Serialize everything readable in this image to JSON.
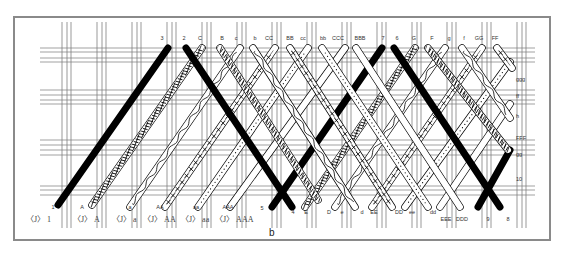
{
  "figure": {
    "caption": "b",
    "frame_color": "#8a8a8a",
    "ink_color": "#000000"
  },
  "top_labels": [
    "3",
    "2",
    "C",
    "B",
    "c",
    "b",
    "CC",
    "BB",
    "cc",
    "bb",
    "CCC",
    "BBB",
    "7",
    "6",
    "G",
    "F",
    "g",
    "f",
    "GG",
    "FF"
  ],
  "bottom_labels": [
    "1",
    "A",
    "a",
    "AA",
    "aa",
    "AAA",
    "5",
    "4",
    "E",
    "D",
    "e",
    "d",
    "EE",
    "DD",
    "ee",
    "dd",
    "EEE",
    "DDD",
    "9",
    "8"
  ],
  "right_labels": [
    "ggg",
    "ff",
    "h",
    "FFF",
    "gg",
    "10"
  ],
  "bobbins": [
    {
      "symbol": "〈J〉",
      "label": "1"
    },
    {
      "symbol": "〈J〉",
      "label": "A"
    },
    {
      "symbol": "〈J〉",
      "label": "a"
    },
    {
      "symbol": "〈J〉",
      "label": "AA"
    },
    {
      "symbol": "〈J〉",
      "label": "aa"
    },
    {
      "symbol": "〈J〉",
      "label": "AAA"
    }
  ]
}
